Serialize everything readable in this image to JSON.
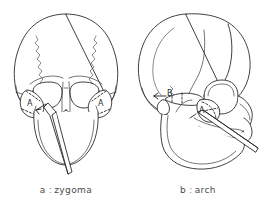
{
  "figure": {
    "background_color": "#ffffff",
    "line_color": "#2b2b2b",
    "panels": [
      {
        "id": "a",
        "view": "frontal-skull",
        "caption_key": "a",
        "caption_separator": ":",
        "caption_text": "zygoma",
        "labels": [
          {
            "text": "A",
            "region": "left-zygomatic-body"
          },
          {
            "text": "A",
            "region": "right-zygomatic-body"
          }
        ],
        "instrument": "elevator"
      },
      {
        "id": "b",
        "view": "lateral-skull",
        "caption_key": "b",
        "caption_separator": ":",
        "caption_text": "arch",
        "labels": [
          {
            "text": "B",
            "region": "zygomatic-arch"
          },
          {
            "text": "A",
            "region": "zygomatic-body"
          }
        ],
        "instrument": "elevator"
      }
    ]
  }
}
